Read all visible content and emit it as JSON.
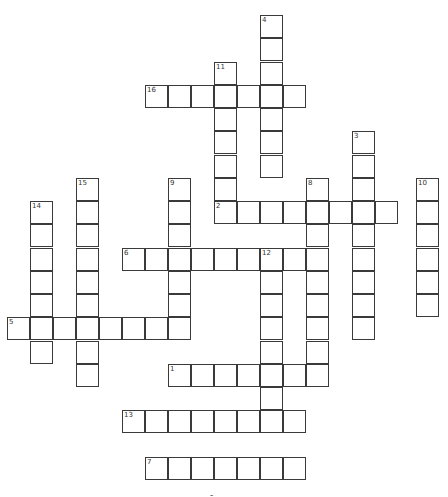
{
  "puzzle": {
    "cell_size": 23,
    "origin_x": 7,
    "origin_y": 15,
    "row_step": 23.25,
    "line_color": "#3a3a3a",
    "footer_mark": "-",
    "words": [
      {
        "number": "4",
        "direction": "down",
        "col": 11,
        "row": 0,
        "length": 7
      },
      {
        "number": "11",
        "direction": "down",
        "col": 9,
        "row": 2,
        "length": 7
      },
      {
        "number": "16",
        "direction": "across",
        "col": 6,
        "row": 3,
        "length": 7
      },
      {
        "number": "3",
        "direction": "down",
        "col": 15,
        "row": 5,
        "length": 9
      },
      {
        "number": "8",
        "direction": "down",
        "col": 13,
        "row": 7,
        "length": 9
      },
      {
        "number": "10",
        "direction": "down",
        "col": 17.8,
        "row": 7,
        "length": 6
      },
      {
        "number": "9",
        "direction": "down",
        "col": 7,
        "row": 7,
        "length": 7
      },
      {
        "number": "15",
        "direction": "down",
        "col": 3,
        "row": 7,
        "length": 9
      },
      {
        "number": "14",
        "direction": "down",
        "col": 1,
        "row": 8,
        "length": 7
      },
      {
        "number": "2",
        "direction": "across",
        "col": 9,
        "row": 8,
        "length": 8
      },
      {
        "number": "6",
        "direction": "across",
        "col": 5,
        "row": 10,
        "length": 9
      },
      {
        "number": "12",
        "direction": "down",
        "col": 11,
        "row": 10,
        "length": 8
      },
      {
        "number": "5",
        "direction": "across",
        "col": 0,
        "row": 13,
        "length": 8
      },
      {
        "number": "1",
        "direction": "across",
        "col": 7,
        "row": 15,
        "length": 7
      },
      {
        "number": "13",
        "direction": "across",
        "col": 5,
        "row": 17,
        "length": 8
      },
      {
        "number": "7",
        "direction": "across",
        "col": 6,
        "row": 19,
        "length": 7
      }
    ]
  }
}
